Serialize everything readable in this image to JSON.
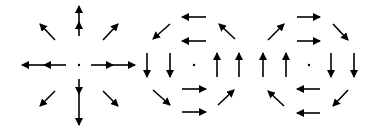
{
  "figure": {
    "background": "#ffffff",
    "arrow_color": "#000000",
    "panels": [
      {
        "name": "radial-outward-field",
        "center": [
          79,
          65
        ],
        "arrows": [
          {
            "from": [
              79,
              36
            ],
            "to": [
              79,
              22
            ]
          },
          {
            "from": [
              79,
              22
            ],
            "to": [
              79,
              6
            ]
          },
          {
            "from": [
              79,
              79
            ],
            "to": [
              79,
              94
            ]
          },
          {
            "from": [
              79,
              94
            ],
            "to": [
              79,
              125
            ]
          },
          {
            "from": [
              66,
              65
            ],
            "to": [
              44,
              65
            ]
          },
          {
            "from": [
              44,
              65
            ],
            "to": [
              22,
              65
            ]
          },
          {
            "from": [
              91,
              65
            ],
            "to": [
              113,
              65
            ]
          },
          {
            "from": [
              113,
              65
            ],
            "to": [
              135,
              65
            ]
          },
          {
            "from": [
              55,
              40
            ],
            "to": [
              40,
              24
            ]
          },
          {
            "from": [
              103,
              40
            ],
            "to": [
              118,
              24
            ]
          },
          {
            "from": [
              55,
              91
            ],
            "to": [
              40,
              106
            ]
          },
          {
            "from": [
              103,
              91
            ],
            "to": [
              118,
              106
            ]
          }
        ]
      },
      {
        "name": "counterclockwise-rotation-field",
        "center": [
          194,
          65
        ],
        "arrows": [
          {
            "from": [
              206,
              17
            ],
            "to": [
              182,
              17
            ]
          },
          {
            "from": [
              206,
              41
            ],
            "to": [
              182,
              41
            ]
          },
          {
            "from": [
              170,
              24
            ],
            "to": [
              153,
              39
            ]
          },
          {
            "from": [
              235,
              39
            ],
            "to": [
              219,
              24
            ]
          },
          {
            "from": [
              147,
              53
            ],
            "to": [
              147,
              77
            ]
          },
          {
            "from": [
              170,
              53
            ],
            "to": [
              170,
              77
            ]
          },
          {
            "from": [
              217,
              77
            ],
            "to": [
              217,
              53
            ]
          },
          {
            "from": [
              239,
              77
            ],
            "to": [
              239,
              53
            ]
          },
          {
            "from": [
              153,
              90
            ],
            "to": [
              170,
              105
            ]
          },
          {
            "from": [
              218,
              105
            ],
            "to": [
              234,
              90
            ]
          },
          {
            "from": [
              182,
              89
            ],
            "to": [
              206,
              89
            ]
          },
          {
            "from": [
              182,
              112
            ],
            "to": [
              206,
              112
            ]
          }
        ]
      },
      {
        "name": "clockwise-rotation-field",
        "center": [
          309,
          65
        ],
        "arrows": [
          {
            "from": [
              297,
              17
            ],
            "to": [
              320,
              17
            ]
          },
          {
            "from": [
              297,
              41
            ],
            "to": [
              320,
              41
            ]
          },
          {
            "from": [
              268,
              40
            ],
            "to": [
              284,
              24
            ]
          },
          {
            "from": [
              333,
              24
            ],
            "to": [
              348,
              40
            ]
          },
          {
            "from": [
              263,
              77
            ],
            "to": [
              263,
              53
            ]
          },
          {
            "from": [
              286,
              77
            ],
            "to": [
              286,
              53
            ]
          },
          {
            "from": [
              331,
              53
            ],
            "to": [
              331,
              77
            ]
          },
          {
            "from": [
              354,
              53
            ],
            "to": [
              354,
              77
            ]
          },
          {
            "from": [
              284,
              106
            ],
            "to": [
              268,
              91
            ]
          },
          {
            "from": [
              348,
              90
            ],
            "to": [
              333,
              106
            ]
          },
          {
            "from": [
              320,
              89
            ],
            "to": [
              297,
              89
            ]
          },
          {
            "from": [
              320,
              113
            ],
            "to": [
              297,
              113
            ]
          }
        ]
      }
    ]
  }
}
